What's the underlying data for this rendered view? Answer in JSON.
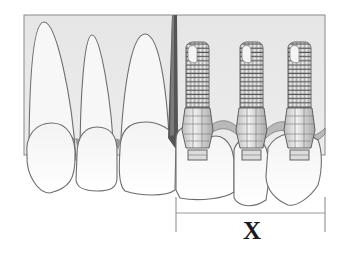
{
  "diagram": {
    "colors": {
      "background": "#ffffff",
      "bone_panel": "#e4e4e4",
      "outline": "#6e6e6e",
      "tooth_fill": "#f7f7f7",
      "gingiva_fill": "#b9b9b9",
      "divider_wedge": "#555555",
      "implant_fill": "#d6d6d6",
      "implant_thread": "#555555",
      "dimension_line": "#999999",
      "label_color": "#1a1a1a"
    },
    "natural_teeth": [
      {
        "name": "central-incisor",
        "root_apex_y": 22
      },
      {
        "name": "lateral-incisor",
        "root_apex_y": 35
      },
      {
        "name": "canine",
        "root_apex_y": 34
      }
    ],
    "implants": [
      {
        "name": "implant-1"
      },
      {
        "name": "implant-2"
      },
      {
        "name": "implant-3"
      }
    ],
    "dimension": {
      "label": "X",
      "from_x": 176,
      "to_x": 325
    }
  }
}
